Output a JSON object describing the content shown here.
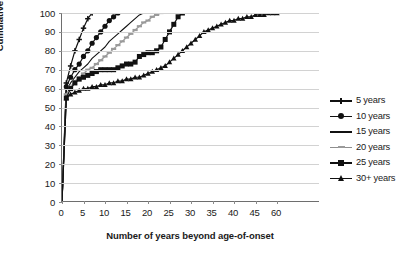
{
  "chart_data": {
    "type": "line",
    "title": "",
    "xlabel": "Number of years beyond age-of-onset",
    "ylabel": "Cumulative percent",
    "xlim": [
      0,
      60
    ],
    "ylim": [
      0,
      100
    ],
    "grid": true,
    "legend_position": "right",
    "x_tick_labels": [
      "0",
      "5",
      "10",
      "15",
      "20",
      "25",
      "30",
      "35",
      "40",
      "45",
      "60"
    ],
    "x_tick_values": [
      0,
      5,
      10,
      15,
      20,
      25,
      30,
      35,
      40,
      45,
      50
    ],
    "y_tick_labels": [
      "0",
      "10",
      "20",
      "30",
      "40",
      "50",
      "60",
      "70",
      "80",
      "90",
      "100"
    ],
    "y_tick_values": [
      0,
      10,
      20,
      30,
      40,
      50,
      60,
      70,
      80,
      90,
      100
    ],
    "series": [
      {
        "name": "5 years",
        "marker": "cross",
        "color": "#111111",
        "x": [
          0,
          1,
          2,
          3,
          4,
          5,
          6,
          7
        ],
        "y": [
          0,
          63,
          72,
          80,
          86,
          92,
          97,
          100
        ]
      },
      {
        "name": "10 years",
        "marker": "circle",
        "color": "#111111",
        "x": [
          0,
          1,
          2,
          3,
          4,
          5,
          6,
          7,
          8,
          9,
          10,
          11,
          12,
          13
        ],
        "y": [
          0,
          61,
          66,
          70,
          73,
          77,
          80,
          84,
          87,
          90,
          93,
          96,
          98,
          100
        ]
      },
      {
        "name": "15 years",
        "marker": "none",
        "color": "#111111",
        "x": [
          0,
          1,
          2,
          3,
          4,
          5,
          6,
          7,
          8,
          9,
          10,
          11,
          12,
          13,
          14,
          15,
          16,
          17,
          18,
          19
        ],
        "y": [
          0,
          59,
          63,
          66,
          69,
          71,
          73,
          76,
          78,
          80,
          82,
          85,
          87,
          89,
          91,
          93,
          95,
          97,
          99,
          100
        ]
      },
      {
        "name": "20 years",
        "marker": "dash",
        "color": "#9a9a9a",
        "x": [
          0,
          1,
          2,
          3,
          4,
          5,
          6,
          7,
          8,
          9,
          10,
          11,
          12,
          13,
          14,
          15,
          16,
          17,
          18,
          19,
          20,
          21,
          22,
          23
        ],
        "y": [
          0,
          57,
          61,
          64,
          66,
          68,
          70,
          71,
          73,
          75,
          77,
          79,
          81,
          83,
          85,
          87,
          89,
          91,
          93,
          95,
          96,
          98,
          99,
          100
        ]
      },
      {
        "name": "25 years",
        "marker": "square",
        "color": "#111111",
        "x": [
          0,
          1,
          2,
          3,
          4,
          5,
          6,
          7,
          8,
          9,
          10,
          11,
          12,
          13,
          14,
          15,
          16,
          17,
          18,
          19,
          20,
          21,
          22,
          23,
          24,
          25,
          26,
          27,
          28
        ],
        "y": [
          0,
          55,
          60,
          63,
          65,
          66,
          67,
          68,
          69,
          70,
          70,
          70,
          70,
          71,
          72,
          73,
          73,
          74,
          77,
          78,
          79,
          79,
          80,
          82,
          86,
          90,
          94,
          98,
          100
        ]
      },
      {
        "name": "30+ years",
        "marker": "triangle",
        "color": "#111111",
        "x": [
          0,
          1,
          2,
          3,
          4,
          5,
          6,
          7,
          8,
          9,
          10,
          11,
          12,
          13,
          14,
          15,
          16,
          17,
          18,
          19,
          20,
          21,
          22,
          23,
          24,
          25,
          26,
          27,
          28,
          29,
          30,
          31,
          32,
          33,
          34,
          35,
          36,
          37,
          38,
          39,
          40,
          41,
          42,
          43,
          44,
          45,
          46,
          47,
          48,
          49,
          50
        ],
        "y": [
          0,
          55,
          57,
          58,
          59,
          60,
          60,
          61,
          61,
          62,
          62,
          63,
          63,
          64,
          64,
          65,
          65,
          66,
          66,
          67,
          68,
          69,
          70,
          71,
          72,
          74,
          76,
          78,
          80,
          82,
          84,
          86,
          88,
          90,
          91,
          92,
          93,
          94,
          95,
          96,
          96,
          97,
          97,
          98,
          98,
          99,
          99,
          99,
          100,
          100,
          100
        ]
      }
    ]
  },
  "legend": {
    "items": [
      {
        "label": "5 years"
      },
      {
        "label": "10 years"
      },
      {
        "label": "15 years"
      },
      {
        "label": "20 years"
      },
      {
        "label": "25 years"
      },
      {
        "label": "30+ years"
      }
    ]
  }
}
